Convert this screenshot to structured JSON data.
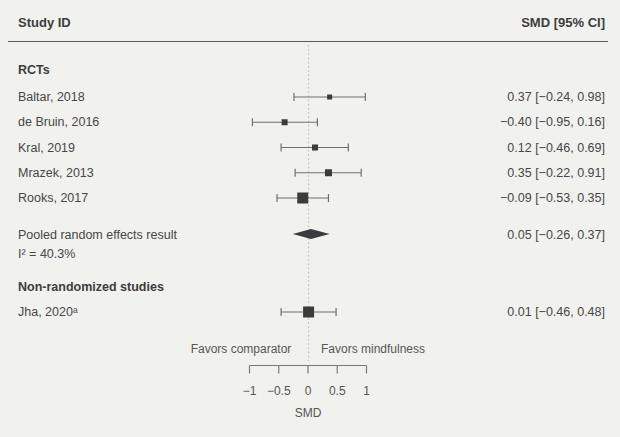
{
  "header": {
    "left": "Study ID",
    "right": "SMD [95% CI]"
  },
  "colors": {
    "background": "#f1f1ee",
    "text": "#474747",
    "heading_text": "#3d3d3d",
    "marker": "#3b3b3b",
    "ci_line": "#6f6f6f",
    "diamond": "#3b3b3b",
    "header_rule": "#595959",
    "dotted_zero_line": "#c3c3bf",
    "axis": "#7a7a7a"
  },
  "chart_data": {
    "type": "forest",
    "xlabel": "SMD",
    "xlim": [
      -1,
      1
    ],
    "zero_line": 0,
    "axis_ticks": [
      {
        "value": -1,
        "label": "−1"
      },
      {
        "value": -0.5,
        "label": "−0.5"
      },
      {
        "value": 0,
        "label": "0"
      },
      {
        "value": 0.5,
        "label": "0.5"
      },
      {
        "value": 1,
        "label": "1"
      }
    ],
    "favors_left": "Favors comparator",
    "favors_right": "Favors mindfulness",
    "groups": [
      {
        "label": "RCTs",
        "studies": [
          {
            "label": "Baltar, 2018",
            "smd": 0.37,
            "ci_low": -0.24,
            "ci_high": 0.98,
            "value_text": "0.37 [−0.24, 0.98]",
            "marker_size": 5
          },
          {
            "label": "de Bruin, 2016",
            "smd": -0.4,
            "ci_low": -0.95,
            "ci_high": 0.16,
            "value_text": "−0.40 [−0.95, 0.16]",
            "marker_size": 6
          },
          {
            "label": "Kral, 2019",
            "smd": 0.12,
            "ci_low": -0.46,
            "ci_high": 0.69,
            "value_text": "0.12 [−0.46, 0.69]",
            "marker_size": 6
          },
          {
            "label": "Mrazek, 2013",
            "smd": 0.35,
            "ci_low": -0.22,
            "ci_high": 0.91,
            "value_text": "0.35 [−0.22, 0.91]",
            "marker_size": 7
          },
          {
            "label": "Rooks, 2017",
            "smd": -0.09,
            "ci_low": -0.53,
            "ci_high": 0.35,
            "value_text": "−0.09 [−0.53, 0.35]",
            "marker_size": 11
          }
        ],
        "pooled": {
          "label": "Pooled random effects result",
          "sublabel": "I² = 40.3%",
          "smd": 0.05,
          "ci_low": -0.26,
          "ci_high": 0.37,
          "value_text": "0.05 [−0.26, 0.37]"
        }
      },
      {
        "label": "Non-randomized studies",
        "studies": [
          {
            "label": "Jha, 2020ᵃ",
            "smd": 0.01,
            "ci_low": -0.46,
            "ci_high": 0.48,
            "value_text": "0.01 [−0.46, 0.48]",
            "marker_size": 11
          }
        ]
      }
    ]
  }
}
